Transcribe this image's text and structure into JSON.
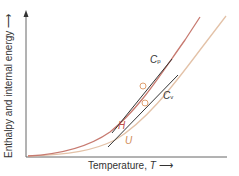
{
  "diagram": {
    "y_axis_label": "Enthalpy and internal energy",
    "x_axis_label": "Temperature, ",
    "x_axis_symbol": "T",
    "curves": [
      {
        "name": "H",
        "label": "H",
        "color": "#c0504d"
      },
      {
        "name": "U",
        "label": "U",
        "color": "#e0a070"
      }
    ],
    "tangents": [
      {
        "name": "Cp",
        "label": "C",
        "subscript": "p",
        "color": "#333333"
      },
      {
        "name": "Cv",
        "label": "C",
        "subscript": "v",
        "color": "#333333"
      }
    ],
    "colors": {
      "axis": "#555555",
      "h_curve": "#c0504d",
      "u_curve": "#e3c2a8",
      "tangent": "#333333",
      "marker_fill": "#ffffff",
      "marker_stroke": "#e0a070"
    }
  }
}
